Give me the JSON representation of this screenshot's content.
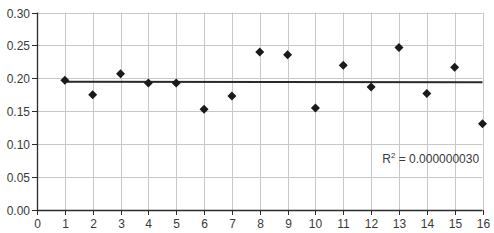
{
  "chart_data": {
    "type": "scatter",
    "title": "",
    "xlabel": "",
    "ylabel": "",
    "xlim": [
      0,
      16
    ],
    "ylim": [
      0,
      0.3
    ],
    "x_ticks": [
      0,
      1,
      2,
      3,
      4,
      5,
      6,
      7,
      8,
      9,
      10,
      11,
      12,
      13,
      14,
      15,
      16
    ],
    "x_tick_labels": [
      "0",
      "1",
      "2",
      "3",
      "4",
      "5",
      "6",
      "7",
      "8",
      "9",
      "10",
      "11",
      "12",
      "13",
      "14",
      "15",
      "16"
    ],
    "y_ticks": [
      0,
      0.05,
      0.1,
      0.15,
      0.2,
      0.25,
      0.3
    ],
    "y_tick_labels": [
      "0.00",
      "0.05",
      "0.10",
      "0.15",
      "0.20",
      "0.25",
      "0.30"
    ],
    "grid": true,
    "legend": null,
    "series": [
      {
        "name": "data",
        "marker": "diamond",
        "color": "#1a1a1a",
        "x": [
          1,
          2,
          3,
          4,
          5,
          6,
          7,
          8,
          9,
          10,
          11,
          12,
          13,
          14,
          15,
          16
        ],
        "y": [
          0.197,
          0.175,
          0.207,
          0.193,
          0.193,
          0.153,
          0.173,
          0.24,
          0.236,
          0.155,
          0.22,
          0.187,
          0.247,
          0.177,
          0.217,
          0.131
        ]
      }
    ],
    "trendline": {
      "type": "linear",
      "color": "#2a2a2a",
      "x": [
        1,
        16
      ],
      "y": [
        0.195,
        0.194
      ]
    },
    "annotations": [
      {
        "text_base": "R",
        "text_sup": "2",
        "text_rest": " = 0.000000030",
        "x": 12.4,
        "y": 0.072
      }
    ]
  },
  "colors": {
    "axis": "#2b2b2b",
    "grid": "#c8c8c8",
    "marker": "#1a1a1a",
    "text": "#3a3a3a"
  }
}
